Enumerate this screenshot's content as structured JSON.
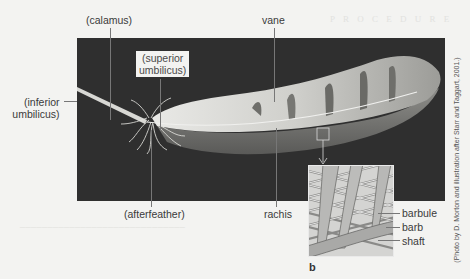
{
  "figure": {
    "panel_letter": "b",
    "credit": "(Photo by D. Morton and illustration after Starr and Taggart, 2001.)",
    "labels": {
      "calamus": "(calamus)",
      "vane": "vane",
      "superior_umbilicus_line1": "(superior",
      "superior_umbilicus_line2": "umbilicus)",
      "inferior_umbilicus_line1": "(inferior",
      "inferior_umbilicus_line2": "umbilicus)",
      "afterfeather": "(afterfeather)",
      "rachis": "rachis"
    },
    "inset_labels": {
      "barbule": "barbule",
      "barb": "barb",
      "shaft": "shaft"
    },
    "colors": {
      "photo_background": "#2f2f2f",
      "page_background": "#f3f3f1",
      "feather": "#d9d9d6",
      "leader_line": "#777777"
    }
  }
}
